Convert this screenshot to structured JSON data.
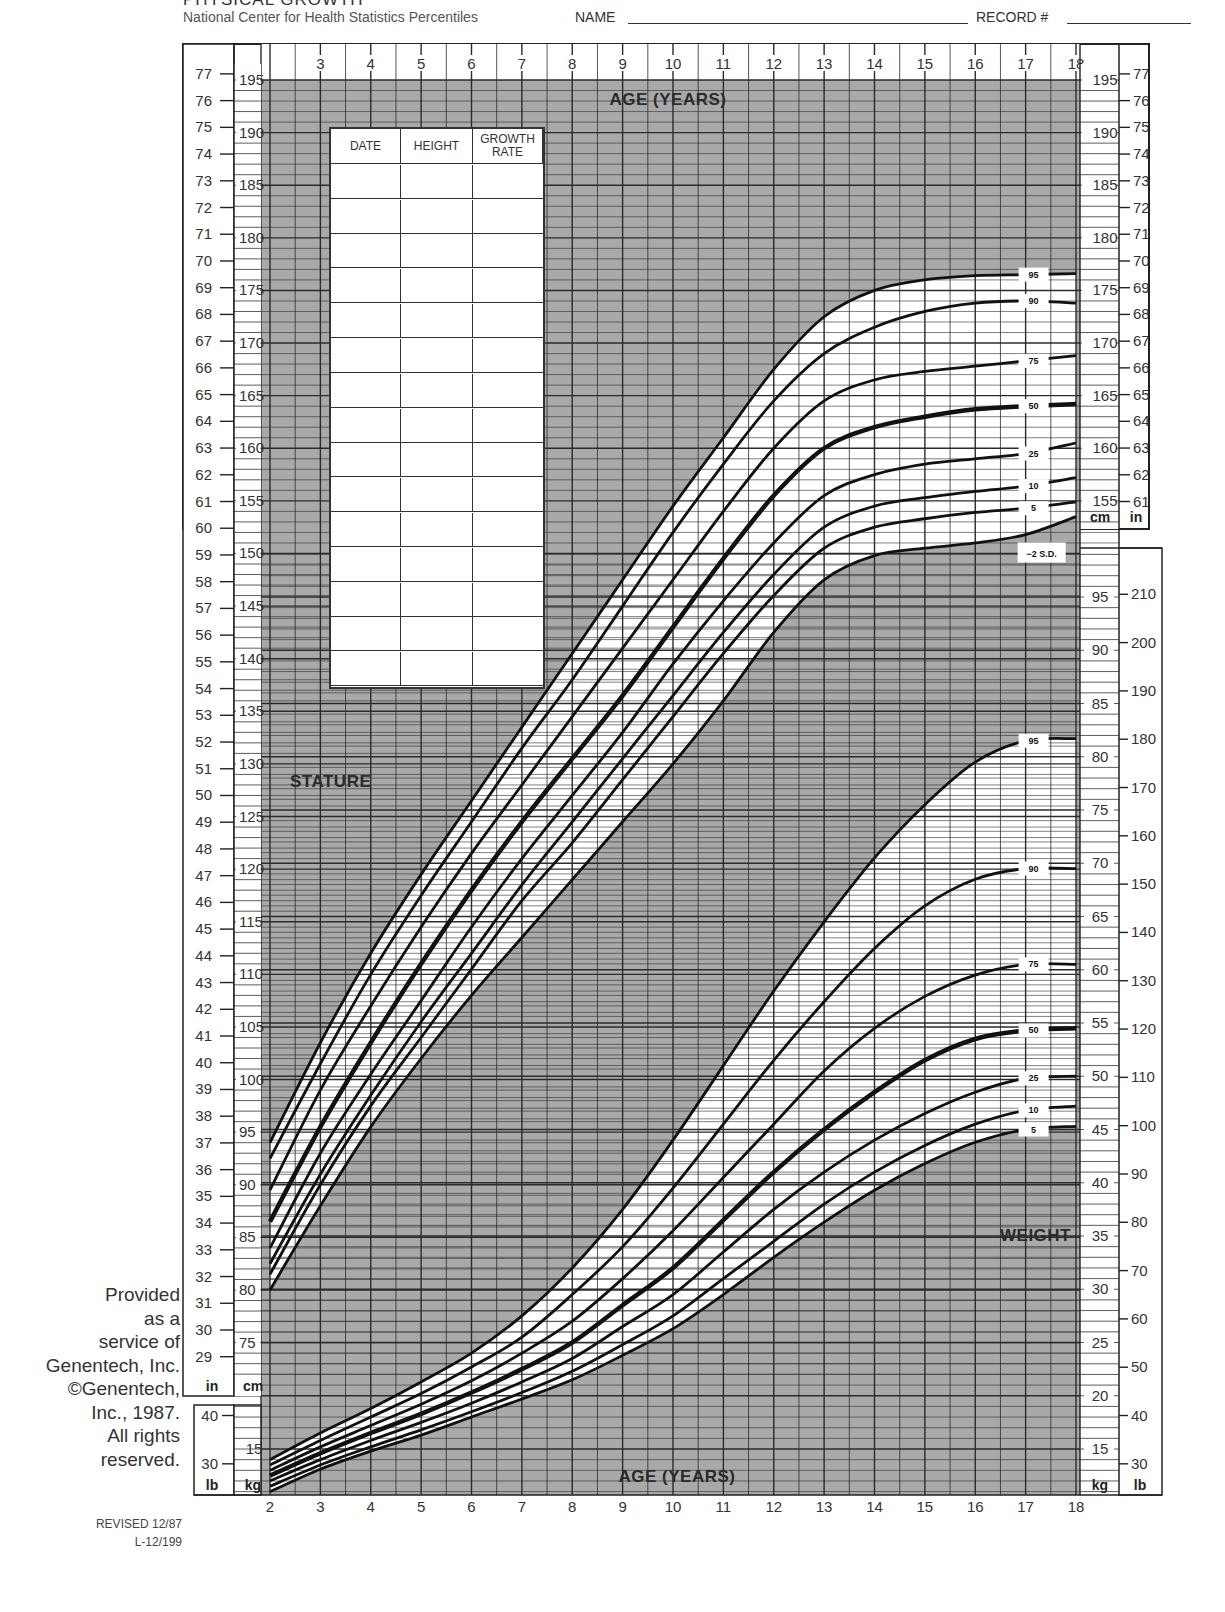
{
  "header": {
    "title": "PHYSICAL GROWTH",
    "subtitle": "National Center for Health Statistics Percentiles",
    "name_label": "NAME",
    "record_label": "RECORD #"
  },
  "side_note": {
    "lines": [
      "Provided",
      "as a",
      "service of",
      "Genentech, Inc.",
      "©Genentech,",
      "Inc., 1987.",
      "All rights",
      "reserved."
    ],
    "revised": "REVISED 12/87",
    "code": "L-12/199"
  },
  "growth_table": {
    "columns": [
      "DATE",
      "HEIGHT",
      "GROWTH RATE"
    ],
    "row_count": 15
  },
  "labels": {
    "age_top": "AGE (YEARS)",
    "age_bottom": "AGE (YEARS)",
    "stature": "STATURE",
    "weight": "WEIGHT",
    "sd_label": "−2 S.D.",
    "unit_in": "in",
    "unit_cm": "cm",
    "unit_lb": "lb",
    "unit_kg": "kg"
  },
  "colors": {
    "shade": "#a9a9a9",
    "grid": "#2b2b2b",
    "curve": "#111111",
    "paper": "#ffffff"
  },
  "chart_data": [
    {
      "type": "line",
      "title": "STATURE",
      "xlabel": "AGE (YEARS)",
      "ylabel": "Stature (cm / in)",
      "x": [
        2,
        3,
        4,
        5,
        6,
        7,
        8,
        9,
        10,
        11,
        12,
        13,
        14,
        15,
        16,
        17,
        18
      ],
      "xlim": [
        2,
        18
      ],
      "ylim_cm": [
        72,
        197
      ],
      "ylim_in": [
        29,
        77
      ],
      "grid": true,
      "series": [
        {
          "name": "95",
          "values": [
            94.0,
            103.5,
            112.0,
            119.5,
            126.5,
            133.5,
            140.5,
            147.5,
            154.5,
            161.0,
            167.5,
            172.5,
            175.0,
            176.0,
            176.4,
            176.5,
            176.6
          ]
        },
        {
          "name": "90",
          "values": [
            92.5,
            101.5,
            110.0,
            117.5,
            124.5,
            131.5,
            138.0,
            145.0,
            152.0,
            158.5,
            164.5,
            169.0,
            171.5,
            173.0,
            173.8,
            174.0,
            173.8
          ]
        },
        {
          "name": "75",
          "values": [
            89.5,
            99.0,
            107.0,
            114.5,
            121.5,
            128.0,
            134.5,
            141.0,
            147.5,
            154.0,
            160.0,
            164.5,
            166.5,
            167.3,
            167.8,
            168.3,
            168.8
          ]
        },
        {
          "name": "50",
          "values": [
            86.5,
            95.5,
            103.5,
            111.0,
            118.0,
            124.5,
            130.5,
            136.5,
            143.0,
            149.5,
            155.5,
            160.0,
            162.0,
            163.0,
            163.7,
            164.0,
            164.2
          ]
        },
        {
          "name": "25",
          "values": [
            84.0,
            93.0,
            100.5,
            107.5,
            114.5,
            121.0,
            127.0,
            133.0,
            139.5,
            145.5,
            151.0,
            155.5,
            157.5,
            158.5,
            159.0,
            159.5,
            160.5
          ]
        },
        {
          "name": "10",
          "values": [
            82.5,
            91.0,
            98.5,
            105.5,
            112.0,
            118.5,
            124.5,
            130.5,
            136.5,
            142.5,
            148.0,
            152.5,
            154.5,
            155.3,
            155.9,
            156.4,
            157.2
          ]
        },
        {
          "name": "5",
          "values": [
            81.5,
            90.0,
            97.5,
            104.0,
            110.5,
            117.0,
            122.5,
            128.5,
            134.5,
            140.5,
            146.0,
            150.5,
            152.5,
            153.3,
            153.9,
            154.3,
            154.9
          ]
        },
        {
          "name": "-2 S.D.",
          "values": [
            80.0,
            88.0,
            95.5,
            102.0,
            108.0,
            113.5,
            119.0,
            124.5,
            130.0,
            136.0,
            142.5,
            147.5,
            149.8,
            150.5,
            151.0,
            151.8,
            153.5
          ]
        }
      ],
      "y_ticks_cm": [
        75,
        80,
        85,
        90,
        95,
        100,
        105,
        110,
        115,
        120,
        125,
        130,
        135,
        140,
        145,
        150,
        155,
        160,
        165,
        170,
        175,
        180,
        185,
        190,
        195
      ],
      "y_ticks_in": [
        29,
        30,
        31,
        32,
        33,
        34,
        35,
        36,
        37,
        38,
        39,
        40,
        41,
        42,
        43,
        44,
        45,
        46,
        47,
        48,
        49,
        50,
        51,
        52,
        53,
        54,
        55,
        56,
        57,
        58,
        59,
        60,
        61,
        62,
        63,
        64,
        65,
        66,
        67,
        68,
        69,
        70,
        71,
        72,
        73,
        74,
        75,
        76,
        77
      ]
    },
    {
      "type": "line",
      "title": "WEIGHT",
      "xlabel": "AGE (YEARS)",
      "ylabel": "Weight (kg / lb)",
      "x": [
        2,
        3,
        4,
        5,
        6,
        7,
        8,
        9,
        10,
        11,
        12,
        13,
        14,
        15,
        16,
        17,
        18
      ],
      "xlim": [
        2,
        18
      ],
      "ylim_kg": [
        10,
        100
      ],
      "ylim_lb": [
        30,
        210
      ],
      "grid": true,
      "series": [
        {
          "name": "95",
          "values": [
            14.0,
            16.5,
            18.8,
            21.3,
            24.0,
            27.5,
            32.0,
            37.5,
            44.0,
            51.0,
            58.0,
            64.5,
            70.5,
            75.5,
            79.5,
            81.5,
            81.7
          ]
        },
        {
          "name": "90",
          "values": [
            13.5,
            15.8,
            18.0,
            20.2,
            22.7,
            25.5,
            29.5,
            34.0,
            39.5,
            45.5,
            51.5,
            57.0,
            62.0,
            66.0,
            68.5,
            69.5,
            69.5
          ]
        },
        {
          "name": "75",
          "values": [
            13.0,
            15.2,
            17.2,
            19.2,
            21.4,
            24.0,
            27.0,
            31.0,
            35.5,
            40.5,
            45.5,
            50.5,
            54.5,
            57.5,
            59.5,
            60.5,
            60.5
          ]
        },
        {
          "name": "50",
          "values": [
            12.5,
            14.6,
            16.5,
            18.3,
            20.3,
            22.5,
            25.0,
            28.5,
            32.0,
            36.5,
            41.0,
            45.0,
            48.5,
            51.5,
            53.5,
            54.3,
            54.5
          ]
        },
        {
          "name": "25",
          "values": [
            12.0,
            14.0,
            15.8,
            17.5,
            19.3,
            21.3,
            23.5,
            26.5,
            29.5,
            33.5,
            37.5,
            41.0,
            44.0,
            46.5,
            48.5,
            49.8,
            50.0
          ]
        },
        {
          "name": "10",
          "values": [
            11.5,
            13.5,
            15.2,
            16.8,
            18.5,
            20.3,
            22.3,
            24.8,
            27.5,
            31.0,
            34.5,
            38.0,
            41.0,
            43.5,
            45.5,
            46.8,
            47.2
          ]
        },
        {
          "name": "5",
          "values": [
            11.0,
            13.1,
            14.8,
            16.3,
            18.0,
            19.7,
            21.5,
            23.8,
            26.3,
            29.5,
            33.0,
            36.3,
            39.3,
            41.8,
            43.8,
            45.0,
            45.3
          ]
        }
      ],
      "y_ticks_kg": [
        15,
        20,
        25,
        30,
        35,
        40,
        45,
        50,
        55,
        60,
        65,
        70,
        75,
        80,
        85,
        90,
        95
      ],
      "y_ticks_lb": [
        30,
        40,
        50,
        60,
        70,
        80,
        90,
        100,
        110,
        120,
        130,
        140,
        150,
        160,
        170,
        180,
        190,
        200,
        210
      ],
      "left_ticks_kg": [
        15
      ],
      "left_ticks_lb": [
        30,
        40
      ]
    }
  ]
}
